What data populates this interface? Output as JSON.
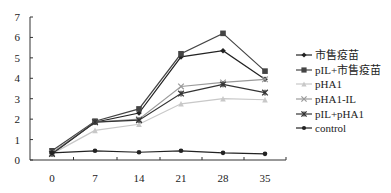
{
  "chart_data": {
    "type": "line",
    "title": "",
    "xlabel": "",
    "ylabel": "",
    "x": [
      0,
      7,
      14,
      21,
      28,
      35
    ],
    "xticks": [
      "0",
      "7",
      "14",
      "21",
      "28",
      "35"
    ],
    "yticks": [
      "0",
      "1",
      "2",
      "3",
      "4",
      "5",
      "6",
      "7"
    ],
    "ylim": [
      0,
      7
    ],
    "grid": false,
    "legend_position": "right",
    "series": [
      {
        "name": "市售疫苗",
        "marker": "diamond",
        "color": "#222222",
        "values": [
          0.3,
          1.85,
          2.3,
          5.05,
          5.35,
          3.95
        ]
      },
      {
        "name": "pIL+市售疫苗",
        "marker": "square",
        "color": "#444444",
        "values": [
          0.45,
          1.9,
          2.5,
          5.2,
          6.2,
          4.35
        ]
      },
      {
        "name": "pHA1",
        "marker": "triangle",
        "color": "#c8c8c8",
        "values": [
          0.3,
          1.45,
          1.75,
          2.75,
          3.0,
          2.95
        ]
      },
      {
        "name": "pHA1-IL",
        "marker": "x",
        "color": "#9a9a9a",
        "values": [
          0.35,
          1.85,
          2.0,
          3.6,
          3.8,
          3.95
        ]
      },
      {
        "name": "pIL+pHA1",
        "marker": "star",
        "color": "#333333",
        "values": [
          0.3,
          1.85,
          1.95,
          3.25,
          3.7,
          3.3
        ]
      },
      {
        "name": "control",
        "marker": "circle",
        "color": "#222222",
        "values": [
          0.35,
          0.45,
          0.38,
          0.45,
          0.35,
          0.3
        ]
      }
    ]
  }
}
